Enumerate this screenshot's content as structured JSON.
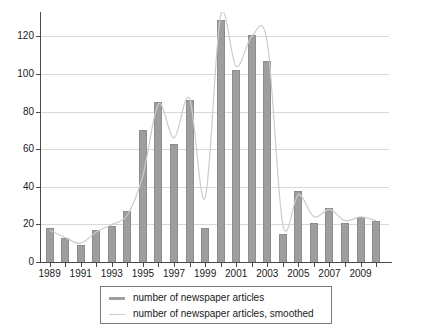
{
  "chart_data": {
    "type": "bar",
    "title": "",
    "subtitle": "",
    "xlabel": "",
    "ylabel": "",
    "xlim": [
      1988.4,
      2010.6
    ],
    "ylim": [
      0,
      133
    ],
    "yticks": [
      0,
      20,
      40,
      60,
      80,
      100,
      120
    ],
    "ytick_labels": [
      "0",
      "20",
      "40",
      "60",
      "80",
      "100",
      "120"
    ],
    "grid": true,
    "legend_position": "below-center",
    "categories": [
      "1989",
      "1990",
      "1991",
      "1992",
      "1993",
      "1994",
      "1995",
      "1996",
      "1997",
      "1998",
      "1999",
      "2000",
      "2001",
      "2002",
      "2003",
      "2004",
      "2005",
      "2006",
      "2007",
      "2008",
      "2009",
      "2010"
    ],
    "xtick_labels": [
      "1989",
      "1991",
      "1993",
      "1995",
      "1997",
      "1999",
      "2001",
      "2003",
      "2005",
      "2007",
      "2009"
    ],
    "series": [
      {
        "name": "number of newspaper articles",
        "type": "bar",
        "color": "#9e9e9e",
        "values": [
          18,
          13,
          9,
          17,
          19,
          27,
          70,
          85,
          63,
          86,
          18,
          129,
          102,
          121,
          107,
          15,
          38,
          21,
          29,
          21,
          24,
          22
        ]
      },
      {
        "name": "number of newspaper articles, smoothed",
        "type": "line",
        "color": "#cccccc",
        "values": [
          17,
          13,
          10,
          16,
          20,
          25,
          46,
          84,
          66,
          87,
          34,
          131,
          104,
          120,
          117,
          20,
          36,
          24,
          28,
          22,
          24,
          22
        ]
      }
    ],
    "legend": [
      {
        "label": "number of newspaper articles",
        "marker": "bar",
        "color": "#9e9e9e"
      },
      {
        "label": "number of newspaper articles, smoothed",
        "marker": "line",
        "color": "#cccccc"
      }
    ]
  },
  "colors": {
    "bar": "#9e9e9e",
    "smooth_line": "#cccccc",
    "grid": "#d8d8d8",
    "axis": "#4a4a4a",
    "text": "#1a1a1a",
    "background": "#ffffff"
  }
}
